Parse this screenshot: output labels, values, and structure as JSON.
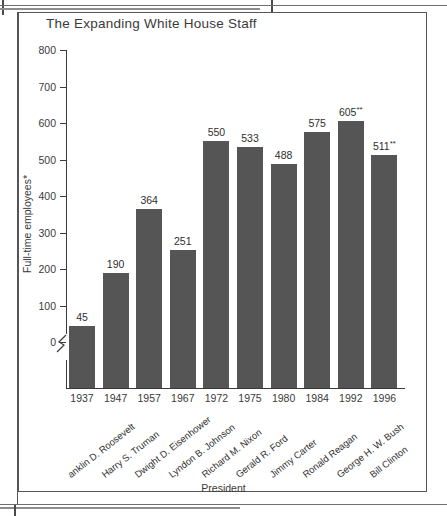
{
  "figure": {
    "title": "The Expanding White House Staff",
    "x_axis_title": "President",
    "y_axis_title": "Full-time employees*"
  },
  "chart_data": {
    "type": "bar",
    "title": "The Expanding White House Staff",
    "xlabel": "President",
    "ylabel": "Full-time employees*",
    "ylim": [
      0,
      800
    ],
    "yticks": [
      0,
      100,
      200,
      300,
      400,
      500,
      600,
      700,
      800
    ],
    "grid": false,
    "legend": "none",
    "axis_break": "y-axis broken below 0",
    "categories": [
      "1937",
      "1947",
      "1957",
      "1967",
      "1972",
      "1975",
      "1980",
      "1984",
      "1992",
      "1996"
    ],
    "category_sublabels": [
      "anklin D. Roosevelt",
      "Harry S. Truman",
      "Dwight D. Eisenhower",
      "Lyndon B. Johnson",
      "Richard M. Nixon",
      "Gerald R. Ford",
      "Jimmy Carter",
      "Ronald Reagan",
      "George H. W. Bush",
      "Bill Clinton"
    ],
    "values": [
      45,
      190,
      364,
      251,
      550,
      533,
      488,
      575,
      605,
      511
    ],
    "value_labels": [
      "45",
      "190",
      "364",
      "251",
      "550",
      "533",
      "488",
      "575",
      "605",
      "511"
    ],
    "value_label_marks": [
      "",
      "",
      "",
      "",
      "",
      "",
      "",
      "",
      "**",
      "**"
    ],
    "bar_color": "#555555"
  }
}
